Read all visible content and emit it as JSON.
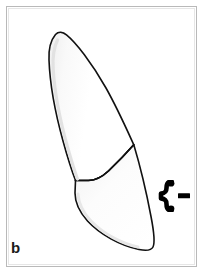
{
  "figure": {
    "panel_label": "b",
    "caption_text": "",
    "frame": {
      "border_color": "#b9b9b9",
      "inner_border_color": "#e6e6e6",
      "background_color": "#ffffff"
    }
  },
  "drawing": {
    "outline_color": "#111111",
    "fill_color": "#ffffff",
    "shading_color": "#ededed",
    "outline_width": 1.6,
    "parts": [
      {
        "name": "root",
        "label": "root",
        "description": "elongated tapering root with rounded apex at top"
      },
      {
        "name": "cervical-line",
        "label": "cervical line",
        "description": "concave cemento-enamel junction curve separating root from crown"
      },
      {
        "name": "crown",
        "label": "crown",
        "description": "crown with pointed incisal tip at lower right"
      }
    ]
  },
  "annotation": {
    "marker_name": "brace-dash-marker",
    "marker_glyph": "{-",
    "marker_color": "#000000",
    "marker_description": "bold brace with dash pointing to cervical region on the right side"
  }
}
